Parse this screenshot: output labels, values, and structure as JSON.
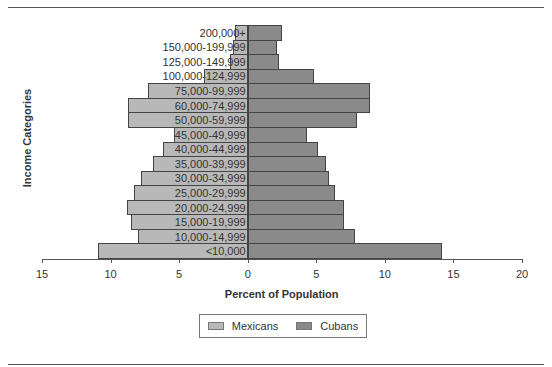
{
  "chart_data": {
    "type": "bar",
    "orientation": "horizontal",
    "subtype": "population-pyramid",
    "title": "",
    "xlabel": "Percent of Population",
    "ylabel": "Income Categories",
    "xlim": [
      -15,
      20
    ],
    "xticks": [
      -15,
      -10,
      -5,
      0,
      5,
      10,
      15,
      20
    ],
    "xtick_labels": [
      "15",
      "10",
      "5",
      "0",
      "5",
      "10",
      "15",
      "20"
    ],
    "categories": [
      "<10,000",
      "10,000-14,999",
      "15,000-19,999",
      "20,000-24,999",
      "25,000-29,999",
      "30,000-34,999",
      "35,000-39,999",
      "40,000-44,999",
      "45,000-49,999",
      "50,000-59,999",
      "60,000-74,999",
      "75,000-99,999",
      "100,000-124,999",
      "125,000-149,999",
      "150,000-199,999",
      "200,000+"
    ],
    "series": [
      {
        "name": "Mexicans",
        "side": "left",
        "color": "#b8b8b8",
        "values": [
          10.9,
          8.0,
          8.5,
          8.8,
          8.3,
          7.8,
          6.9,
          6.2,
          5.4,
          8.7,
          8.7,
          7.3,
          3.2,
          1.3,
          1.1,
          0.9
        ]
      },
      {
        "name": "Cubans",
        "side": "right",
        "color": "#8a8a8a",
        "values": [
          14.2,
          7.8,
          7.0,
          7.0,
          6.4,
          5.9,
          5.7,
          5.1,
          4.3,
          8.0,
          8.9,
          8.9,
          4.8,
          2.3,
          2.1,
          2.5
        ]
      }
    ],
    "legend": {
      "position": "bottom",
      "entries": [
        "Mexicans",
        "Cubans"
      ]
    },
    "grid": false
  }
}
